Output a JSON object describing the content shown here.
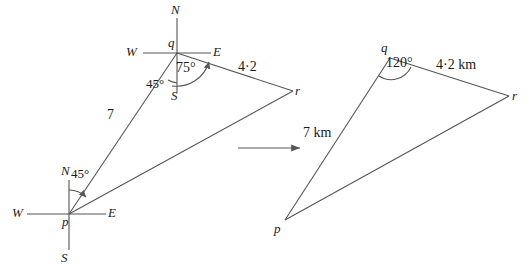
{
  "figure": {
    "stroke_color": "#555555",
    "text_color": "#1a1a1a",
    "background": "#ffffff"
  },
  "left_diagram": {
    "name": "bearings-diagram",
    "vertices": {
      "p": {
        "label": "p",
        "x": 69,
        "y": 214
      },
      "q": {
        "label": "q",
        "x": 177,
        "y": 53
      },
      "r": {
        "label": "r",
        "x": 293,
        "y": 91
      }
    },
    "compass_q": {
      "north": "N",
      "south": "S",
      "east": "E",
      "west": "W"
    },
    "compass_p": {
      "north": "N",
      "south": "S",
      "east": "E",
      "west": "W"
    },
    "angles": {
      "at_p": "45°",
      "at_q_bearing": "45°",
      "at_q_interior": "75°"
    },
    "sides": {
      "pq": "7",
      "qr": "4·2"
    }
  },
  "transform_arrow": {
    "name": "transform-arrow",
    "direction": "right"
  },
  "right_diagram": {
    "name": "triangle-diagram",
    "vertices": {
      "p": {
        "label": "p",
        "x": 285,
        "y": 220
      },
      "q": {
        "label": "q",
        "x": 390,
        "y": 58
      },
      "r": {
        "label": "r",
        "x": 509,
        "y": 96
      }
    },
    "angles": {
      "at_q": "120°"
    },
    "sides": {
      "pq": "7 km",
      "qr": "4·2 km"
    }
  }
}
